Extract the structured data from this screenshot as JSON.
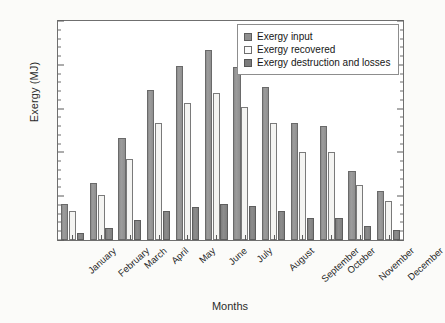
{
  "chart_data": {
    "type": "bar",
    "title": "",
    "xlabel": "Months",
    "ylabel": "Exergy (MJ)",
    "ylim": [
      0,
      2500
    ],
    "ytick_step": 500,
    "yminor_step": 100,
    "grid": false,
    "legend_position": "top-right",
    "categories": [
      "January",
      "February",
      "March",
      "April",
      "May",
      "June",
      "July",
      "August",
      "September",
      "October",
      "November",
      "December"
    ],
    "yticks": [
      "0",
      "500",
      "1000",
      "1500",
      "2000",
      "2500"
    ],
    "series": [
      {
        "name": "Exergy input",
        "color": "#8f8f8f",
        "values": [
          410,
          650,
          1160,
          1710,
          1990,
          2170,
          1975,
          1750,
          1340,
          1300,
          790,
          560
        ]
      },
      {
        "name": "Exergy recovered",
        "color": "#f4f4f2",
        "values": [
          330,
          510,
          920,
          1340,
          1560,
          1680,
          1520,
          1340,
          1010,
          1010,
          630,
          440
        ]
      },
      {
        "name": "Exergy destruction and losses",
        "color": "#7c7c7c",
        "values": [
          85,
          135,
          225,
          330,
          380,
          415,
          385,
          330,
          255,
          255,
          160,
          110
        ]
      }
    ]
  },
  "legend": {
    "items": [
      "Exergy input",
      "Exergy recovered",
      "Exergy destruction and losses"
    ]
  }
}
